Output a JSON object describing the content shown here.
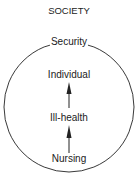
{
  "diagram": {
    "outer_label": "SOCIETY",
    "boundary_label": "Security",
    "nodes": [
      "Individual",
      "Ill-health",
      "Nursing"
    ],
    "flow": "Nursing → Ill-health → Individual",
    "colors": {
      "stroke": "#222222",
      "background": "#ffffff"
    }
  }
}
